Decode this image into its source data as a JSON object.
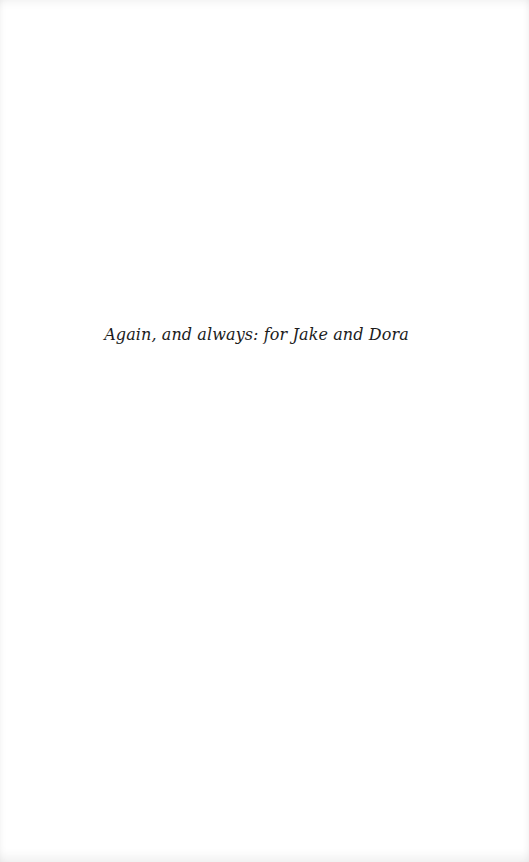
{
  "page": {
    "type": "dedication",
    "background_color": "#ffffff",
    "text_color": "#1c1c1c"
  },
  "dedication": {
    "text": "Again, and always: for Jake and Dora"
  }
}
